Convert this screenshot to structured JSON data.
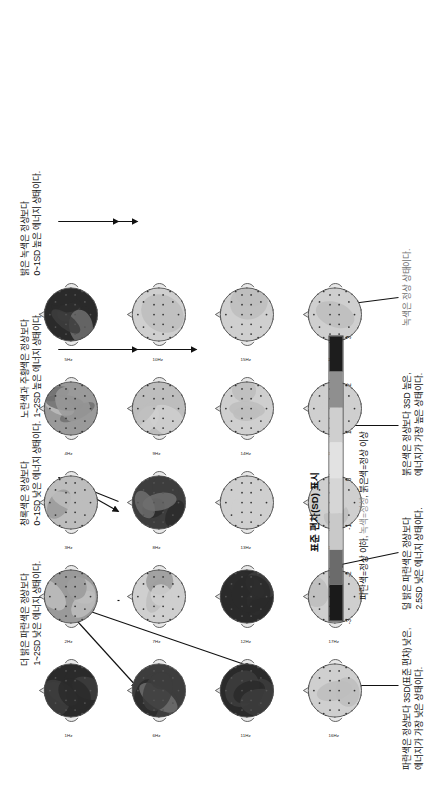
{
  "figure": {
    "title_hidden": "",
    "frequency_unit": "Hz"
  },
  "topomaps": {
    "rows": 4,
    "cols": 5,
    "labels": [
      [
        "1Hz",
        "2Hz",
        "3Hz",
        "4Hz",
        "5Hz"
      ],
      [
        "6Hz",
        "7Hz",
        "8Hz",
        "9Hz",
        "10Hz"
      ],
      [
        "11Hz",
        "12Hz",
        "13Hz",
        "14Hz",
        "15Hz"
      ],
      [
        "16Hz",
        "17Hz",
        "18Hz",
        "19Hz",
        "20Hz"
      ]
    ],
    "intensity": [
      [
        2.8,
        1.2,
        0.6,
        1.1,
        2.6
      ],
      [
        2.4,
        0.4,
        2.3,
        0.5,
        0.2
      ],
      [
        2.9,
        3.0,
        0.1,
        0.3,
        0.2
      ],
      [
        0.2,
        0.2,
        0.2,
        0.1,
        0.1
      ]
    ]
  },
  "annotations_top": [
    {
      "id": "annotation-blue-light",
      "line1": "더 밝은 파란색은 정상보다",
      "line2": "1~2SD 낮은 에너지 상태이다."
    },
    {
      "id": "annotation-cyan",
      "line1": "청록색은 정상보다",
      "line2": "0~1SD 낮은 에너지 상태이다."
    },
    {
      "id": "annotation-yellow-orange",
      "line1": "노란색과 주황색은 정상보다",
      "line2": "1~2SD 높은 에너지 상태이다."
    },
    {
      "id": "annotation-light-green",
      "line1": "밝은 녹색은 정상보다",
      "line2": "0~1SD 높은 에너지 상태이다."
    }
  ],
  "annotations_bottom": [
    {
      "id": "annotation-blue-3sd",
      "line1": "파란색은 정상보다 3SD(표준 편차) 낮은,",
      "line2": "에너지가 가장 낮은 상태이다."
    },
    {
      "id": "annotation-blue-2p5sd",
      "line1": "덜 밝은 파란색은 정상보다",
      "line2": "2.5SD 낮은 에너지 상태이다."
    },
    {
      "id": "annotation-red-3sd",
      "line1": "붉은색은 정상보다 3SD 높은,",
      "line2": "에너지가 가장 높은 상태이다."
    },
    {
      "id": "annotation-green-normal",
      "line1": "녹색은 정상 상태이다.",
      "line2": ""
    }
  ],
  "colorbar": {
    "title": "표준 편차(SD) 표시",
    "caption_part1": "파란색=정상 이하, ",
    "caption_green": "녹색=정상",
    "caption_part2": ", 붉은색=정상 이상",
    "ticks": [
      "-3",
      "-2",
      "-1",
      "0",
      "1",
      "2",
      "3"
    ],
    "min": -3,
    "max": 3,
    "segments": [
      "#1a1a1a",
      "#6b6b6b",
      "#c9c9c9",
      "#d6d6d6",
      "#e2e2e2",
      "#cfcfcf",
      "#8f8f8f",
      "#1d1d1d"
    ]
  }
}
